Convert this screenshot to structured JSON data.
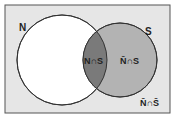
{
  "diagram": {
    "type": "venn",
    "colors": {
      "background": "#e6e6e6",
      "border": "#555555",
      "set_n_fill": "#ffffff",
      "set_s_fill": "#b3b3b3",
      "intersection_fill": "#7a7a7a"
    },
    "sets": [
      {
        "id": "N",
        "label": "N"
      },
      {
        "id": "S",
        "label": "S"
      }
    ],
    "regions": {
      "n_and_s": "N∩S",
      "notn_and_s": "N̄∩S",
      "notn_and_nots": "N̄∩S̄"
    }
  }
}
